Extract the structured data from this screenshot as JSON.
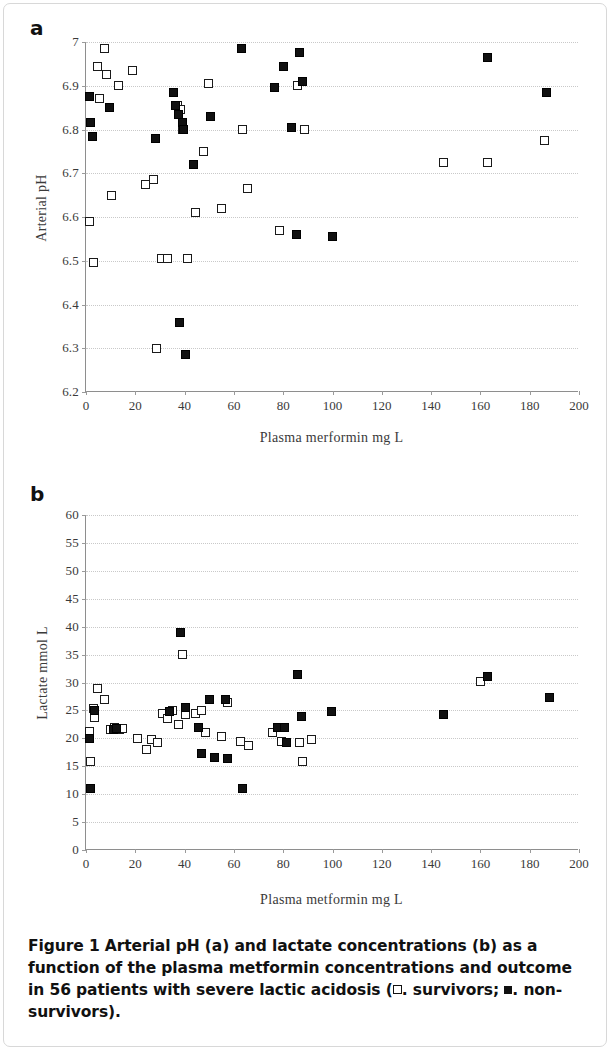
{
  "figure": {
    "caption_label": "Figure 1",
    "caption_text": " Arterial pH (a) and lactate concentrations (b) as a function of the plasma metformin concentrations and outcome in 56 patients with severe lactic acidosis (",
    "caption_legend_survivors": ". survivors; ",
    "caption_legend_nonsurvivors": ". non-survivors).",
    "panel_a_letter": "a",
    "panel_b_letter": "b"
  },
  "legend": {
    "open_marker_label": "survivors",
    "filled_marker_label": "non-survivors",
    "open_marker_color": "#ffffff",
    "filled_marker_color": "#111111",
    "marker_outline_color": "#111111"
  },
  "chart_data": [
    {
      "type": "scatter",
      "panel": "a",
      "title": "",
      "xlabel": "Plasma merformin mg L",
      "ylabel": "Arterial pH",
      "xlim": [
        0,
        200
      ],
      "ylim": [
        6.2,
        7.0
      ],
      "xticks": [
        0,
        20,
        40,
        60,
        80,
        100,
        120,
        140,
        160,
        180,
        200
      ],
      "xtick_labels": [
        "0",
        "20",
        "40",
        "60",
        "80",
        "100",
        "120",
        "140",
        "160",
        "180",
        "200"
      ],
      "yticks": [
        6.2,
        6.3,
        6.4,
        6.5,
        6.6,
        6.7,
        6.8,
        6.9,
        7.0
      ],
      "ytick_labels": [
        "6.2",
        "6.3",
        "6.4",
        "6.5",
        "6.6",
        "6.7",
        "6.8",
        "6.9",
        "7"
      ],
      "grid": true,
      "legend_position": "none",
      "series": [
        {
          "name": "survivors",
          "marker": "open-square",
          "points": [
            [
              1.5,
              6.59
            ],
            [
              3.0,
              6.495
            ],
            [
              4.5,
              6.945
            ],
            [
              5.5,
              6.87
            ],
            [
              7.5,
              6.985
            ],
            [
              8.5,
              6.925
            ],
            [
              10.5,
              6.65
            ],
            [
              13.0,
              6.9
            ],
            [
              19.0,
              6.935
            ],
            [
              24.0,
              6.675
            ],
            [
              27.5,
              6.685
            ],
            [
              28.5,
              6.3
            ],
            [
              30.5,
              6.505
            ],
            [
              33.0,
              6.505
            ],
            [
              37.0,
              6.855
            ],
            [
              38.5,
              6.845
            ],
            [
              39.0,
              6.8
            ],
            [
              41.0,
              6.505
            ],
            [
              44.5,
              6.61
            ],
            [
              47.5,
              6.75
            ],
            [
              49.5,
              6.905
            ],
            [
              55.0,
              6.62
            ],
            [
              63.5,
              6.8
            ],
            [
              65.5,
              6.665
            ],
            [
              78.5,
              6.57
            ],
            [
              86.0,
              6.9
            ],
            [
              88.5,
              6.8
            ],
            [
              145.0,
              6.725
            ],
            [
              163.0,
              6.725
            ],
            [
              186.0,
              6.775
            ]
          ]
        },
        {
          "name": "non-survivors",
          "marker": "filled-square",
          "points": [
            [
              1.5,
              6.875
            ],
            [
              2.0,
              6.815
            ],
            [
              2.5,
              6.785
            ],
            [
              9.5,
              6.85
            ],
            [
              28.0,
              6.78
            ],
            [
              35.5,
              6.885
            ],
            [
              36.5,
              6.855
            ],
            [
              37.5,
              6.835
            ],
            [
              38.0,
              6.36
            ],
            [
              39.0,
              6.815
            ],
            [
              39.5,
              6.8
            ],
            [
              40.5,
              6.285
            ],
            [
              43.5,
              6.72
            ],
            [
              50.5,
              6.83
            ],
            [
              63.0,
              6.985
            ],
            [
              76.5,
              6.895
            ],
            [
              80.0,
              6.945
            ],
            [
              83.5,
              6.805
            ],
            [
              85.5,
              6.56
            ],
            [
              86.5,
              6.975
            ],
            [
              88.0,
              6.91
            ],
            [
              100.0,
              6.555
            ],
            [
              163.0,
              6.965
            ],
            [
              187.0,
              6.885
            ]
          ]
        }
      ]
    },
    {
      "type": "scatter",
      "panel": "b",
      "title": "",
      "xlabel": "Plasma metformin mg L",
      "ylabel": "Lactate mmol L",
      "xlim": [
        0,
        200
      ],
      "ylim": [
        0,
        60
      ],
      "xticks": [
        0,
        20,
        40,
        60,
        80,
        100,
        120,
        140,
        160,
        180,
        200
      ],
      "xtick_labels": [
        "0",
        "20",
        "40",
        "60",
        "80",
        "100",
        "120",
        "140",
        "160",
        "180",
        "200"
      ],
      "yticks": [
        0,
        5,
        10,
        15,
        20,
        25,
        30,
        35,
        40,
        45,
        50,
        55,
        60
      ],
      "ytick_labels": [
        "0",
        "5",
        "10",
        "15",
        "20",
        "25",
        "30",
        "35",
        "40",
        "45",
        "50",
        "55",
        "60"
      ],
      "grid": true,
      "legend_position": "none",
      "series": [
        {
          "name": "survivors",
          "marker": "open-square",
          "points": [
            [
              1.5,
              21.3
            ],
            [
              2.0,
              15.8
            ],
            [
              3.0,
              25.3
            ],
            [
              3.5,
              23.8
            ],
            [
              4.5,
              29.0
            ],
            [
              7.5,
              27.0
            ],
            [
              10.0,
              21.5
            ],
            [
              11.5,
              22.0
            ],
            [
              13.5,
              21.5
            ],
            [
              15.0,
              21.8
            ],
            [
              21.0,
              20.0
            ],
            [
              24.5,
              18.0
            ],
            [
              26.5,
              19.8
            ],
            [
              29.0,
              19.2
            ],
            [
              31.0,
              24.5
            ],
            [
              33.0,
              23.5
            ],
            [
              35.0,
              25.0
            ],
            [
              37.5,
              22.5
            ],
            [
              39.0,
              35.0
            ],
            [
              40.5,
              24.3
            ],
            [
              44.5,
              24.5
            ],
            [
              47.0,
              25.0
            ],
            [
              48.5,
              21.0
            ],
            [
              55.0,
              20.3
            ],
            [
              57.5,
              26.5
            ],
            [
              62.5,
              19.5
            ],
            [
              66.0,
              18.8
            ],
            [
              75.5,
              21.0
            ],
            [
              79.5,
              19.5
            ],
            [
              86.5,
              19.2
            ],
            [
              88.0,
              15.8
            ],
            [
              91.5,
              19.8
            ],
            [
              160.0,
              30.2
            ]
          ]
        },
        {
          "name": "non-survivors",
          "marker": "filled-square",
          "points": [
            [
              1.5,
              20.0
            ],
            [
              2.0,
              11.0
            ],
            [
              3.5,
              25.0
            ],
            [
              11.0,
              21.5
            ],
            [
              12.5,
              21.8
            ],
            [
              34.0,
              24.8
            ],
            [
              38.5,
              39.0
            ],
            [
              40.5,
              25.5
            ],
            [
              45.5,
              22.0
            ],
            [
              47.0,
              17.2
            ],
            [
              50.0,
              27.0
            ],
            [
              52.0,
              16.5
            ],
            [
              56.5,
              27.0
            ],
            [
              57.5,
              16.3
            ],
            [
              63.5,
              11.0
            ],
            [
              77.5,
              22.0
            ],
            [
              80.5,
              22.0
            ],
            [
              81.5,
              19.3
            ],
            [
              86.0,
              31.5
            ],
            [
              87.5,
              24.0
            ],
            [
              99.5,
              24.8
            ],
            [
              145.0,
              24.2
            ],
            [
              163.0,
              31.0
            ],
            [
              188.0,
              27.3
            ]
          ]
        }
      ]
    }
  ]
}
